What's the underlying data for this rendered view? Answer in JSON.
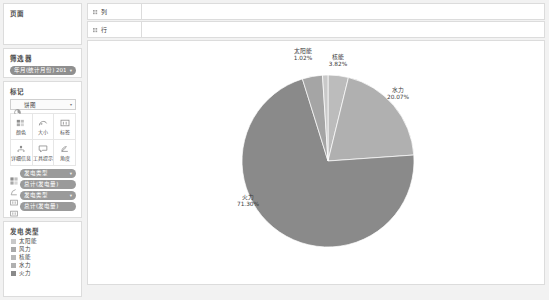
{
  "app": {
    "bg": "#f2f2f2",
    "panel_bg": "#ffffff",
    "border": "#dcdcdc"
  },
  "pages_card": {
    "title": "页面"
  },
  "filters_card": {
    "title": "筛选器",
    "pill_label": "年月(统计月份) 2017..",
    "pill_caret": "▾",
    "pill_color": "#8f8f8f"
  },
  "marks_card": {
    "title": "标记",
    "mark_type_icon": "pie-icon",
    "mark_type": "饼图",
    "caret": "▾",
    "buttons": [
      {
        "label": "颜色",
        "icon": "color-palette-icon"
      },
      {
        "label": "大小",
        "icon": "size-icon"
      },
      {
        "label": "标签",
        "icon": "label-icon"
      },
      {
        "label": "详细信息",
        "icon": "detail-icon"
      },
      {
        "label": "工具提示",
        "icon": "tooltip-icon"
      },
      {
        "label": "角度",
        "icon": "angle-icon"
      }
    ],
    "shelf_pills": [
      {
        "icon": "color-encoding-icon",
        "label": "发电类型",
        "caret": "▾"
      },
      {
        "icon": "angle-encoding-icon",
        "label": "总计(发电量)",
        "caret": ""
      },
      {
        "icon": "label-encoding-icon",
        "label": "发电类型",
        "caret": "▾"
      },
      {
        "icon": "label-encoding-icon",
        "label": "总计(发电量)",
        "caret": ""
      }
    ],
    "pill_color": "#9a9a9a"
  },
  "legend_card": {
    "title": "发电类型",
    "items": [
      {
        "label": "太阳能",
        "color": "#c9c9c9"
      },
      {
        "label": "风力",
        "color": "#a9a9a9"
      },
      {
        "label": "核能",
        "color": "#b8b8b8"
      },
      {
        "label": "水力",
        "color": "#b0b0b0"
      },
      {
        "label": "火力",
        "color": "#8a8a8a"
      }
    ]
  },
  "shelves": {
    "columns_label": "列",
    "rows_label": "行",
    "grip_icon": "grip-icon"
  },
  "chart_data": {
    "type": "pie",
    "title": "",
    "legend_title": "发电类型",
    "legend_position": "left-bottom",
    "categories": [
      "火力",
      "水力",
      "核能",
      "风力",
      "太阳能"
    ],
    "values": [
      71.3,
      20.07,
      3.82,
      3.79,
      1.02
    ],
    "unit": "%",
    "slices": [
      {
        "label": "火力",
        "value": 71.3,
        "display": "71.30%",
        "color": "#8a8a8a"
      },
      {
        "label": "水力",
        "value": 20.07,
        "display": "20.07%",
        "color": "#b0b0b0"
      },
      {
        "label": "核能",
        "value": 3.82,
        "display": "3.82%",
        "color": "#bcbcbc"
      },
      {
        "label": "风力",
        "value": 3.79,
        "display": "",
        "color": "#a5a5a5"
      },
      {
        "label": "太阳能",
        "value": 1.02,
        "display": "1.02%",
        "color": "#c9c9c9"
      }
    ],
    "labels": {
      "solar": {
        "name": "太阳能",
        "value": "1.02%"
      },
      "nuclear": {
        "name": "核能",
        "value": "3.82%"
      },
      "hydro": {
        "name": "水力",
        "value": "20.07%"
      },
      "thermal": {
        "name": "火力",
        "value": "71.30%"
      }
    }
  }
}
